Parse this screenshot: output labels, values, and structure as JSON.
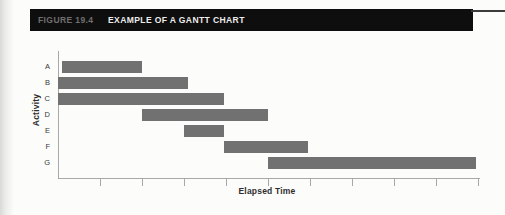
{
  "header": {
    "figure_label": "FIGURE 19.4",
    "title": "EXAMPLE OF A GANTT CHART",
    "bar_color": "#0e0e0e",
    "figure_label_color": "#6f6f6f",
    "title_color": "#ededed"
  },
  "chart_data": {
    "type": "bar",
    "orientation": "horizontal-gantt",
    "title": "",
    "xlabel": "Elapsed Time",
    "ylabel": "Activity",
    "categories": [
      "A",
      "B",
      "C",
      "D",
      "E",
      "F",
      "G"
    ],
    "bars": [
      {
        "activity": "A",
        "start": 0.1,
        "end": 2.0
      },
      {
        "activity": "B",
        "start": 0.0,
        "end": 3.1
      },
      {
        "activity": "C",
        "start": 0.0,
        "end": 3.95
      },
      {
        "activity": "D",
        "start": 2.0,
        "end": 5.0
      },
      {
        "activity": "E",
        "start": 3.0,
        "end": 3.95
      },
      {
        "activity": "F",
        "start": 3.95,
        "end": 5.95
      },
      {
        "activity": "G",
        "start": 5.0,
        "end": 9.95
      }
    ],
    "xlim": [
      0,
      10
    ],
    "x_ticks": [
      1,
      2,
      3,
      4,
      5,
      6,
      7,
      8,
      9,
      10
    ],
    "x_tick_labels_shown": false,
    "grid": false,
    "legend": "none",
    "bar_color": "#717171",
    "axis_color": "#a8a8a8"
  }
}
